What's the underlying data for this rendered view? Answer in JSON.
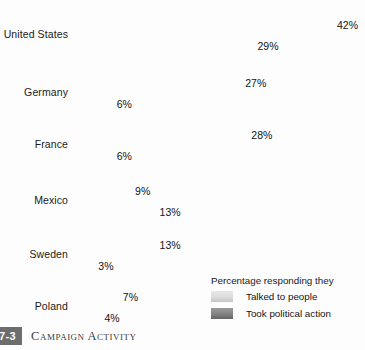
{
  "chart_data": {
    "type": "bar",
    "orientation": "horizontal",
    "title": "Campaign Activity",
    "xlabel": "",
    "ylabel": "",
    "xlim": [
      0,
      42
    ],
    "grid": false,
    "legend_position": "bottom-right",
    "legend_title": "Percentage responding they",
    "categories": [
      "United States",
      "Germany",
      "France",
      "Mexico",
      "Sweden",
      "Poland"
    ],
    "series": [
      {
        "name": "Talked to people",
        "color": "#dcdcdc",
        "values": [
          42,
          27,
          28,
          9,
          13,
          7
        ],
        "labels": [
          "42%",
          "27%",
          "28%",
          "9%",
          "13%",
          "7%"
        ]
      },
      {
        "name": "Took political action",
        "color": "#7d7d7d",
        "values": [
          29,
          6,
          6,
          13,
          3,
          4
        ],
        "labels": [
          "29%",
          "6%",
          "6%",
          "13%",
          "3%",
          "4%"
        ]
      }
    ]
  },
  "caption": {
    "badge": "7-3",
    "text": "Campaign Activity"
  }
}
